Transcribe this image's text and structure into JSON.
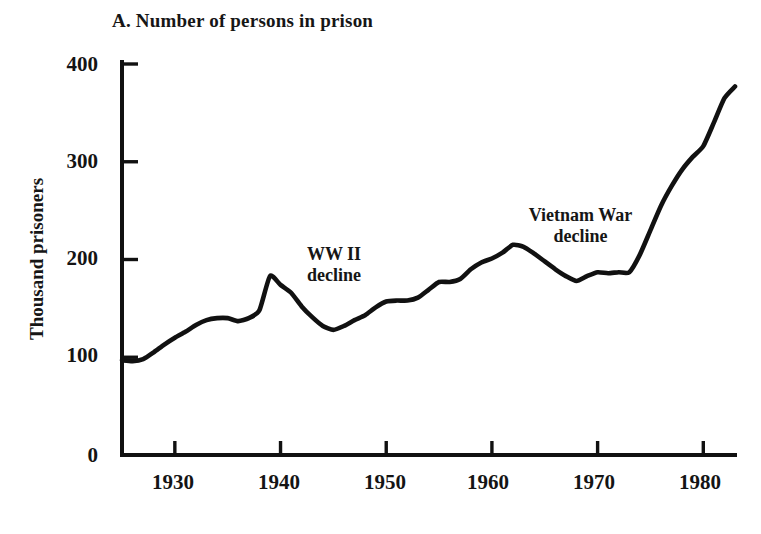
{
  "chart_data": {
    "type": "line",
    "title": "A. Number of persons in prison",
    "xlabel": "",
    "ylabel": "Thousand prisoners",
    "xlim": [
      1925,
      1983
    ],
    "ylim": [
      0,
      400
    ],
    "yticks": [
      0,
      100,
      200,
      300,
      400
    ],
    "ytick_labels": [
      "0",
      "100",
      "200",
      "300",
      "400"
    ],
    "xticks": [
      1930,
      1940,
      1950,
      1960,
      1970,
      1980
    ],
    "xtick_labels": [
      "1930",
      "1940",
      "1950",
      "1960",
      "1970",
      "1980"
    ],
    "grid": false,
    "legend": "none",
    "series": [
      {
        "name": "Thousand prisoners",
        "x": [
          1925,
          1926,
          1927,
          1928,
          1929,
          1930,
          1931,
          1932,
          1933,
          1934,
          1935,
          1936,
          1937,
          1938,
          1939,
          1940,
          1941,
          1942,
          1943,
          1944,
          1945,
          1946,
          1947,
          1948,
          1949,
          1950,
          1951,
          1952,
          1953,
          1954,
          1955,
          1956,
          1957,
          1958,
          1959,
          1960,
          1961,
          1962,
          1963,
          1964,
          1965,
          1966,
          1967,
          1968,
          1969,
          1970,
          1971,
          1972,
          1973,
          1974,
          1975,
          1976,
          1977,
          1978,
          1979,
          1980,
          1981,
          1982,
          1983
        ],
        "values": [
          97,
          96,
          98,
          105,
          113,
          120,
          126,
          133,
          138,
          140,
          140,
          137,
          140,
          148,
          183,
          174,
          166,
          152,
          141,
          132,
          128,
          132,
          138,
          143,
          151,
          157,
          158,
          158,
          161,
          169,
          177,
          177,
          180,
          190,
          197,
          201,
          207,
          215,
          213,
          206,
          198,
          190,
          183,
          178,
          183,
          187,
          186,
          187,
          187,
          205,
          230,
          255,
          275,
          292,
          305,
          316,
          340,
          365,
          377
        ]
      }
    ],
    "annotations": [
      {
        "id": "ww2-decline",
        "lines": [
          "WW II",
          "decline"
        ],
        "x_px": 334,
        "y_px": 244
      },
      {
        "id": "vietnam-war-decline",
        "lines": [
          "Vietnam War",
          "decline"
        ],
        "x_px": 580,
        "y_px": 205
      }
    ],
    "line_color": "#111111",
    "axis_color": "#111111",
    "background_color": "#ffffff"
  }
}
